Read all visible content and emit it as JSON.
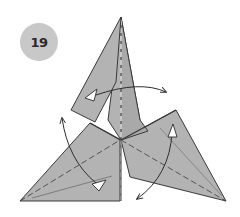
{
  "step": {
    "number": "19"
  },
  "colors": {
    "badge": "#c8c8c8",
    "paper": "#b3b3b3",
    "paper_dark": "#a6a6a6",
    "line": "#3a3a3a",
    "arrow": "#2e2e2e",
    "white": "#ffffff"
  },
  "diagram": {
    "arrows": [
      {
        "name": "top-flap-swing-arrow",
        "direction": "left-to-right"
      },
      {
        "name": "left-flap-swing-arrow",
        "direction": "down-to-up"
      },
      {
        "name": "right-flap-swing-arrow",
        "direction": "up-to-down"
      }
    ]
  }
}
